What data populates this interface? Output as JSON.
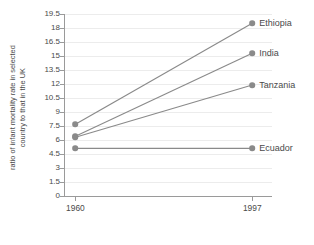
{
  "chart_data": {
    "type": "line",
    "title": "",
    "subtitle": "",
    "xlabel": "",
    "ylabel": "ratio of infant mortality rate in selected country to that in the UK",
    "ylabel_lines": [
      "ratio of infant mortality rate in selected",
      "country to that in the UK"
    ],
    "x": [
      "1960",
      "1997"
    ],
    "xtick_labels": [
      "1960",
      "1997"
    ],
    "ytick_labels": [
      "0",
      "1.5",
      "3",
      "4.5",
      "6",
      "7.5",
      "9",
      "10.5",
      "12",
      "13.5",
      "15",
      "16.5",
      "18",
      "19.5"
    ],
    "ytick_values": [
      0,
      1.5,
      3,
      4.5,
      6,
      7.5,
      9,
      10.5,
      12,
      13.5,
      15,
      16.5,
      18,
      19.5
    ],
    "ylim": [
      0,
      19.5
    ],
    "grid": true,
    "grid_axis": "y",
    "legend": "inline-right-of-endpoint",
    "markers": true,
    "series": [
      {
        "name": "Ethiopia",
        "values": [
          7.7,
          18.5
        ]
      },
      {
        "name": "India",
        "values": [
          6.4,
          15.3
        ]
      },
      {
        "name": "Tanzania",
        "values": [
          6.3,
          11.9
        ]
      },
      {
        "name": "Ecuador",
        "values": [
          5.1,
          5.1
        ]
      }
    ],
    "colors": {
      "series_line": "#8a8a8a",
      "marker": "#8a8a8a",
      "gridline": "#ececec",
      "axis": "#9a9a9a",
      "text": "#4a4a4a",
      "background": "#ffffff"
    }
  }
}
